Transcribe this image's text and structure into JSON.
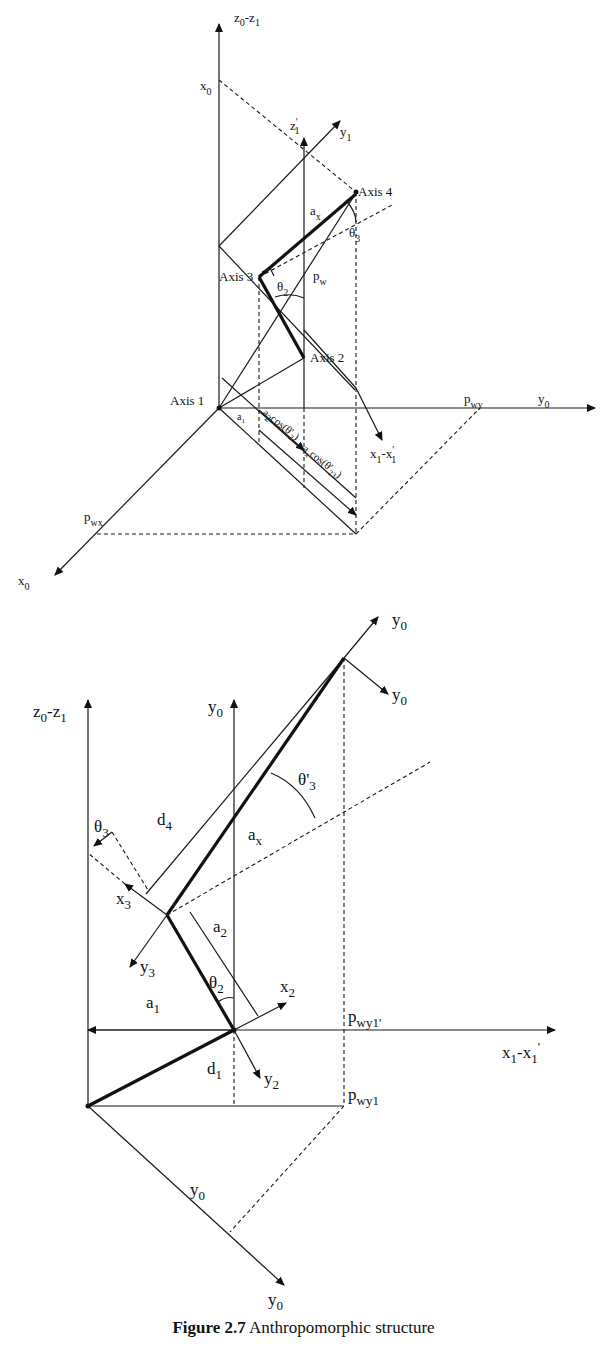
{
  "figure": {
    "caption_number": "Figure 2.7",
    "caption_text": " Anthropomorphic structure"
  },
  "top_diagram": {
    "axes": {
      "z0_z1": "z0-z1",
      "x0_upper": "x0",
      "z1_prime": "z'1",
      "y1": "y1",
      "y0": "y0",
      "x0_lower": "x0",
      "x1_x1prime": "x1-x'1"
    },
    "joints": [
      "Axis 1",
      "Axis 2",
      "Axis 3",
      "Axis 4"
    ],
    "labels": {
      "ax": "ax",
      "theta3": "θ'3",
      "theta2": "θ2",
      "pw": "pw",
      "pwx": "pwx",
      "pwy": "pwy",
      "a1_small": "a1",
      "a2_cos": "a2cos(θ'2)",
      "ax_cos": "axcos(θ'23)"
    }
  },
  "bottom_diagram": {
    "axes": {
      "z0_z1": "z0-z1",
      "y0_vertical": "y0",
      "y0_top_a": "y0",
      "y0_top_b": "y0",
      "x1_x1prime": "x1-x1'",
      "x2": "x2",
      "y2": "y2",
      "x3": "x3",
      "y3": "y3",
      "y0_diag_label": "y0",
      "y0_bottom": "y0"
    },
    "labels": {
      "theta3": "θ3",
      "theta3_prime": "θ'3",
      "theta2": "θ2",
      "d4": "d4",
      "ax": "ax",
      "a2": "a2",
      "a1": "a1",
      "d1": "d1",
      "pwy1_prime": "pwy1'",
      "pwy1": "pwy1"
    }
  }
}
